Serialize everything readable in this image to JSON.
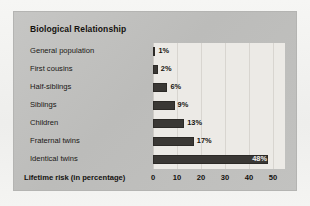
{
  "card": {
    "title": "Biological Relationship"
  },
  "chart_data": {
    "type": "bar",
    "orientation": "horizontal",
    "title": "Biological Relationship",
    "xlabel": "Lifetime risk (in percentage)",
    "ylabel": "",
    "xlim": [
      0,
      55
    ],
    "xticks": [
      0,
      10,
      20,
      30,
      40,
      50
    ],
    "xtick_labels": [
      "0",
      "10",
      "20",
      "30",
      "40",
      "50"
    ],
    "grid": true,
    "grid_axis": "x",
    "legend": false,
    "value_suffix": "%",
    "bar_color": "#3a3835",
    "plot_background": "#eceae6",
    "categories": [
      "General population",
      "First cousins",
      "Half-siblings",
      "Siblings",
      "Children",
      "Fraternal twins",
      "Identical twins"
    ],
    "values": [
      1,
      2,
      6,
      9,
      13,
      17,
      48
    ],
    "value_labels": [
      "1%",
      "2%",
      "6%",
      "9%",
      "13%",
      "17%",
      "48%"
    ]
  },
  "axis": {
    "title": "Lifetime risk (in percentage)"
  }
}
